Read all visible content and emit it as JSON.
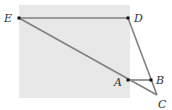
{
  "diagram": {
    "type": "geometry",
    "background_region": {
      "x": 19,
      "y": 5,
      "width": 111,
      "height": 93,
      "color": "#e8e8e8"
    },
    "line_color": "#808080",
    "point_color": "#111111",
    "points": [
      {
        "label": "E",
        "x": 19,
        "y": 18,
        "label_x": 4,
        "label_y": 22
      },
      {
        "label": "D",
        "x": 128,
        "y": 18,
        "label_x": 134,
        "label_y": 22
      },
      {
        "label": "A",
        "x": 128,
        "y": 80,
        "label_x": 114,
        "label_y": 86
      },
      {
        "label": "B",
        "x": 151,
        "y": 80,
        "label_x": 156,
        "label_y": 84
      },
      {
        "label": "C",
        "x": 157,
        "y": 95,
        "label_x": 158,
        "label_y": 108
      }
    ],
    "segments": [
      [
        "E",
        "D"
      ],
      [
        "E",
        "C"
      ],
      [
        "D",
        "C"
      ],
      [
        "A",
        "B"
      ]
    ]
  }
}
